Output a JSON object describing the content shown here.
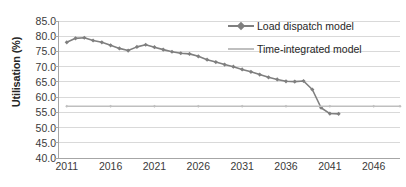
{
  "chart_data": {
    "type": "line",
    "title": "",
    "xlabel": "",
    "ylabel": "Utilisation (%)",
    "ylim": [
      40.0,
      85.0
    ],
    "ytick_step": 5.0,
    "yticks": [
      "85.0",
      "80.0",
      "75.0",
      "70.0",
      "65.0",
      "60.0",
      "55.0",
      "50.0",
      "45.0",
      "40.0"
    ],
    "ytick_values": [
      85.0,
      80.0,
      75.0,
      70.0,
      65.0,
      60.0,
      55.0,
      50.0,
      45.0,
      40.0
    ],
    "xlim": [
      2010,
      2049
    ],
    "xticks": [
      "2011",
      "2016",
      "2021",
      "2026",
      "2031",
      "2036",
      "2041",
      "2046"
    ],
    "xtick_values": [
      2011,
      2016,
      2021,
      2026,
      2031,
      2036,
      2041,
      2046
    ],
    "grid": "horizontal",
    "legend_position": "top-right",
    "x": [
      2011,
      2012,
      2013,
      2014,
      2015,
      2016,
      2017,
      2018,
      2019,
      2020,
      2021,
      2022,
      2023,
      2024,
      2025,
      2026,
      2027,
      2028,
      2029,
      2030,
      2031,
      2032,
      2033,
      2034,
      2035,
      2036,
      2037,
      2038,
      2039,
      2040,
      2041,
      2042
    ],
    "series": [
      {
        "name": "Load dispatch model",
        "color": "#7f7f7f",
        "marker": "diamond",
        "values": [
          78.0,
          79.3,
          79.5,
          78.6,
          78.0,
          77.0,
          76.0,
          75.3,
          76.5,
          77.2,
          76.4,
          75.6,
          74.9,
          74.4,
          74.2,
          73.4,
          72.3,
          71.5,
          70.7,
          70.0,
          69.1,
          68.3,
          67.4,
          66.5,
          65.8,
          65.2,
          65.1,
          65.3,
          62.5,
          56.5,
          54.6,
          54.5
        ]
      },
      {
        "name": "Time-integrated model",
        "color": "#bfbfbf",
        "marker": "none",
        "x": [
          2011,
          2016,
          2021,
          2026,
          2031,
          2036,
          2041,
          2046,
          2049
        ],
        "values": [
          57.0,
          57.0,
          57.0,
          57.0,
          57.0,
          57.0,
          57.0,
          57.0,
          57.0
        ]
      }
    ]
  },
  "legend": {
    "items": [
      {
        "label": "Load dispatch model",
        "color": "#7f7f7f",
        "marker": "diamond"
      },
      {
        "label": "Time-integrated model",
        "color": "#bfbfbf",
        "marker": "none"
      }
    ]
  },
  "colors": {
    "grid": "#d9d9d9",
    "axis": "#a6a6a6",
    "text": "#3a3a3a",
    "background": "#ffffff"
  }
}
